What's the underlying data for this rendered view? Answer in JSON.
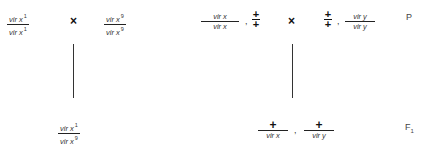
{
  "parental": {
    "label": "P",
    "cross_symbol": "×",
    "left_parent": {
      "numerator": "vir x",
      "numerator_sup": "1",
      "denominator": "vir x",
      "denominator_sup": "1"
    },
    "right_parent": {
      "numerator": "vir x",
      "numerator_sup": "9",
      "denominator": "vir x",
      "denominator_sup": "9"
    },
    "dihybrid_left": {
      "fraction": {
        "numerator": "vir x",
        "denominator": "vir x"
      },
      "separator": ",",
      "plus_over_plus": "+"
    },
    "dihybrid_right": {
      "plus_over_plus": "+",
      "separator": ",",
      "fraction": {
        "numerator": "vir y",
        "denominator": "vir y"
      }
    }
  },
  "f1": {
    "label": "F",
    "label_sub": "1",
    "left_offspring": {
      "numerator": "vir x",
      "numerator_sup": "1",
      "denominator": "vir x",
      "denominator_sup": "9"
    },
    "right_offspring": {
      "first": {
        "numerator": "+",
        "denominator": "vir x"
      },
      "separator": ",",
      "second": {
        "numerator": "+",
        "denominator": "vir y"
      }
    }
  }
}
